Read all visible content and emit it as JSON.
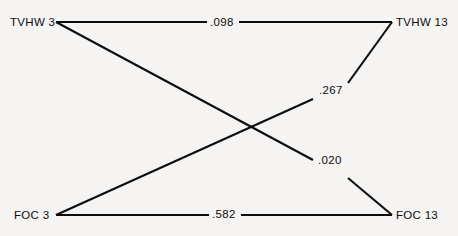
{
  "diagram": {
    "type": "path-diagram",
    "background_color": "#f5f4f2",
    "line_color": "#0d0d0d",
    "nodes": [
      {
        "id": "tvhw3",
        "label": "TVHW 3",
        "position": "top-left"
      },
      {
        "id": "tvhw13",
        "label": "TVHW 13",
        "position": "top-right"
      },
      {
        "id": "foc3",
        "label": "FOC 3",
        "position": "bottom-left"
      },
      {
        "id": "foc13",
        "label": "FOC 13",
        "position": "bottom-right"
      }
    ],
    "edges": [
      {
        "id": "tvhw3-tvhw13",
        "from": "tvhw3",
        "to": "tvhw13",
        "label": ".098"
      },
      {
        "id": "foc3-tvhw13",
        "from": "foc3",
        "to": "tvhw13",
        "label": ".267"
      },
      {
        "id": "tvhw3-foc13",
        "from": "tvhw3",
        "to": "foc13",
        "label": ".020"
      },
      {
        "id": "foc3-foc13",
        "from": "foc3",
        "to": "foc13",
        "label": ".582"
      }
    ]
  }
}
